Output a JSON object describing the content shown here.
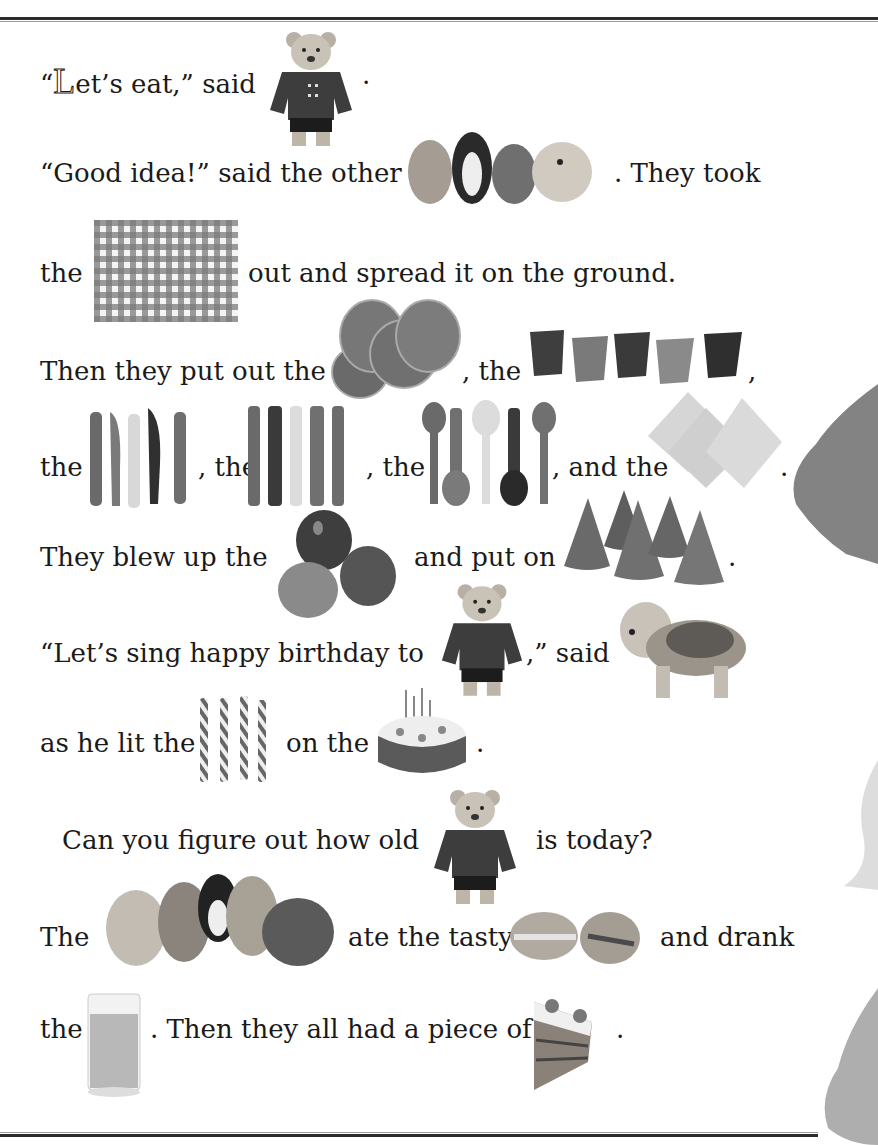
{
  "page": {
    "type": "rebus story page",
    "accent_colors": {
      "ink": "#1a1a1a",
      "rule": "#2b2b2b",
      "rule_light": "#9a9a9a"
    }
  },
  "story": {
    "line1": {
      "open_quote": "“",
      "dropcap": "L",
      "text": "et’s eat,” said",
      "end": ".",
      "picture": "teddy-bear"
    },
    "line2": {
      "text": "“Good idea!” said the other",
      "picture": "toy-friends",
      "after": ". They took"
    },
    "line3": {
      "text": "the",
      "picture": "checkered-tablecloth",
      "after": "out and spread it on the ground."
    },
    "line4": {
      "text": "Then they put out the",
      "picture1": "paper-plates",
      "mid": ", the",
      "picture2": "paper-cups",
      "end": ","
    },
    "line5": {
      "text": "the",
      "picture1": "plastic-knives",
      "mid1": ", the",
      "picture2": "plastic-forks",
      "mid2": ", the",
      "picture3": "plastic-spoons",
      "mid3": ", and the",
      "picture4": "napkins",
      "end": "."
    },
    "line6": {
      "text": "They blew up the",
      "picture1": "balloons",
      "mid": "and put on",
      "picture2": "party-hats",
      "end": "."
    },
    "line7": {
      "text": "“Let’s sing happy birthday to",
      "picture1": "teddy-bear",
      "mid": ",” said",
      "picture2": "dog"
    },
    "line8": {
      "text": "as he lit the",
      "picture1": "candles",
      "mid": "on the",
      "picture2": "birthday-cake",
      "end": "."
    },
    "line9": {
      "text": "Can you figure out how old",
      "picture": "teddy-bear",
      "after": "is today?"
    },
    "line10": {
      "text": "The",
      "picture1": "toy-friends-group",
      "mid": "ate the tasty",
      "picture2": "sandwiches",
      "after": "and drank"
    },
    "line11": {
      "text": "the",
      "picture1": "glass-of-juice",
      "mid": ". Then they all had a piece of",
      "picture2": "slice-of-cake",
      "end": "."
    }
  }
}
